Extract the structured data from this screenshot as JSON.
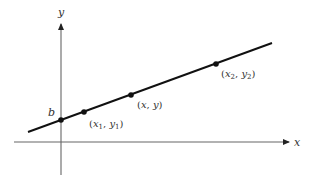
{
  "diagram": {
    "type": "linear-function-graph",
    "axes": {
      "x_label": "x",
      "y_label": "y"
    },
    "intercept_label": "b",
    "points": [
      {
        "id": "p1",
        "label_open": "(",
        "var_x": "x",
        "sub_x": "1",
        "sep": ", ",
        "var_y": "y",
        "sub_y": "1",
        "label_close": ")"
      },
      {
        "id": "p",
        "label_open": "(",
        "var_x": "x",
        "sub_x": "",
        "sep": ", ",
        "var_y": "y",
        "sub_y": "",
        "label_close": ")"
      },
      {
        "id": "p2",
        "label_open": "(",
        "var_x": "x",
        "sub_x": "2",
        "sep": ", ",
        "var_y": "y",
        "sub_y": "2",
        "label_close": ")"
      }
    ],
    "colors": {
      "axis": "#555555",
      "line": "#111111",
      "point": "#111111",
      "text": "#333333"
    }
  }
}
